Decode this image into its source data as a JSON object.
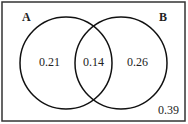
{
  "diagram": {
    "type": "venn",
    "sets": [
      {
        "name": "A",
        "only": "0.21"
      },
      {
        "name": "B",
        "only": "0.26"
      }
    ],
    "intersection": "0.14",
    "outside": "0.39",
    "colors": {
      "stroke": "#111111",
      "background": "#ffffff"
    }
  }
}
